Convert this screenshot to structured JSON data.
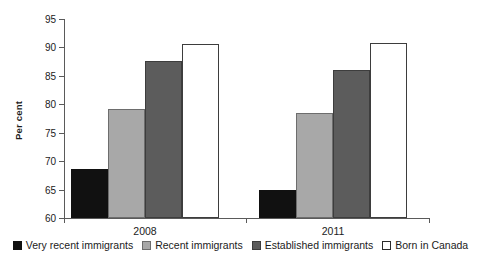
{
  "chart_data": {
    "type": "bar",
    "title": "",
    "xlabel": "",
    "ylabel": "Per cent",
    "ylim": [
      60,
      95
    ],
    "ytick_step": 5,
    "yticks": [
      95,
      90,
      85,
      80,
      75,
      70,
      65,
      60
    ],
    "ytick_labels": [
      "95",
      "90",
      "85",
      "80",
      "75",
      "70",
      "65",
      "60"
    ],
    "grid": false,
    "legend_position": "bottom",
    "categories": [
      "2008",
      "2011"
    ],
    "series": [
      {
        "name": "Very recent immigrants",
        "color": "#111111",
        "values": [
          68.6,
          65.0
        ]
      },
      {
        "name": "Recent immigrants",
        "color": "#a8a8a8",
        "values": [
          79.2,
          78.4
        ]
      },
      {
        "name": "Established immigrants",
        "color": "#5c5c5c",
        "values": [
          87.7,
          86.1
        ]
      },
      {
        "name": "Born in Canada",
        "color": "#ffffff",
        "values": [
          90.6,
          90.8
        ]
      }
    ]
  },
  "axis": {
    "y_label": "Per cent"
  },
  "legend": {
    "items": [
      {
        "label": "Very recent immigrants",
        "color": "#111111"
      },
      {
        "label": "Recent immigrants",
        "color": "#a8a8a8"
      },
      {
        "label": "Established immigrants",
        "color": "#5c5c5c"
      },
      {
        "label": "Born in Canada",
        "color": "#ffffff"
      }
    ]
  }
}
